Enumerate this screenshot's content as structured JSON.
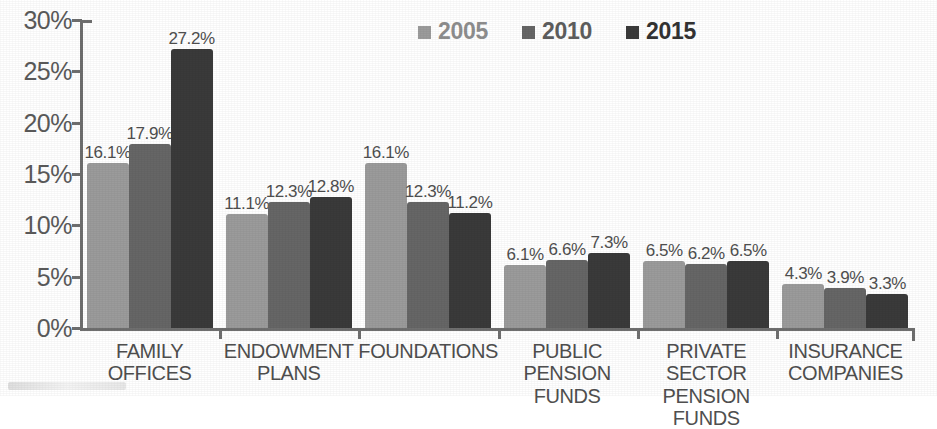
{
  "chart_data": {
    "type": "bar",
    "title": "",
    "subtitle": "",
    "xlabel": "",
    "ylabel": "",
    "ylim": [
      0,
      30
    ],
    "ytick_labels": [
      "0%",
      "5%",
      "10%",
      "15%",
      "20%",
      "25%",
      "30%"
    ],
    "ytick_values": [
      0,
      5,
      10,
      15,
      20,
      25,
      30
    ],
    "grid": false,
    "legend_position": "top-center",
    "value_suffix": "%",
    "categories": [
      "FAMILY OFFICES",
      "ENDOWMENT PLANS",
      "FOUNDATIONS",
      "PUBLIC PENSION FUNDS",
      "PRIVATE SECTOR PENSION FUNDS",
      "INSURANCE COMPANIES"
    ],
    "category_lines": [
      [
        "FAMILY",
        "OFFICES"
      ],
      [
        "ENDOWMENT",
        "PLANS"
      ],
      [
        "FOUNDATIONS"
      ],
      [
        "PUBLIC PENSION",
        "FUNDS"
      ],
      [
        "PRIVATE SECTOR",
        "PENSION FUNDS"
      ],
      [
        "INSURANCE",
        "COMPANIES"
      ]
    ],
    "series": [
      {
        "name": "2005",
        "color": "#9b9b9b",
        "values": [
          16.1,
          11.1,
          16.1,
          6.1,
          6.5,
          4.3
        ],
        "labels": [
          "16.1%",
          "11.1%",
          "16.1%",
          "6.1%",
          "6.5%",
          "4.3%"
        ]
      },
      {
        "name": "2010",
        "color": "#666666",
        "values": [
          17.9,
          12.3,
          12.3,
          6.6,
          6.2,
          3.9
        ],
        "labels": [
          "17.9%",
          "12.3%",
          "12.3%",
          "6.6%",
          "6.2%",
          "3.9%"
        ]
      },
      {
        "name": "2015",
        "color": "#3a3a3a",
        "values": [
          27.2,
          12.8,
          11.2,
          7.3,
          6.5,
          3.3
        ],
        "labels": [
          "27.2%",
          "12.8%",
          "11.2%",
          "7.3%",
          "6.5%",
          "3.3%"
        ]
      }
    ]
  },
  "legend": {
    "items": [
      {
        "label": "2005",
        "color": "#9b9b9b"
      },
      {
        "label": "2010",
        "color": "#666666"
      },
      {
        "label": "2015",
        "color": "#3a3a3a"
      }
    ]
  },
  "axis": {
    "line_color": "#6f6f6f"
  }
}
